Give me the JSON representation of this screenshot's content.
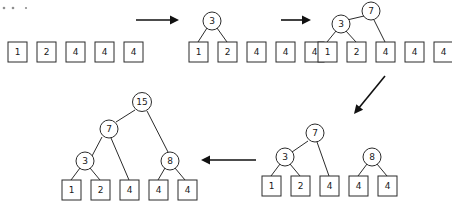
{
  "figure": {
    "title": "",
    "background_color": "#ffffff",
    "stroke_color": "#2b2b2b",
    "arrow_color": "#111111"
  },
  "specks": [
    {
      "name": "speck-1",
      "cx": 4,
      "cy": 8,
      "r": 1.3
    },
    {
      "name": "speck-2",
      "cx": 13,
      "cy": 8,
      "r": 1.3
    },
    {
      "name": "speck-3",
      "cx": 26,
      "cy": 8,
      "r": 1.1
    }
  ],
  "stages": [
    {
      "id": "stage-1",
      "label": "initial-forest",
      "leaves": [
        {
          "value": "1",
          "x": 8,
          "y": 42
        },
        {
          "value": "2",
          "x": 37,
          "y": 42
        },
        {
          "value": "4",
          "x": 66,
          "y": 42
        },
        {
          "value": "4",
          "x": 95,
          "y": 42
        },
        {
          "value": "4",
          "x": 124,
          "y": 42
        }
      ],
      "circles": [],
      "edges": []
    },
    {
      "id": "stage-2",
      "label": "merge-1-and-2-into-3",
      "leaves": [
        {
          "value": "1",
          "x": 189,
          "y": 42
        },
        {
          "value": "2",
          "x": 218,
          "y": 42
        },
        {
          "value": "4",
          "x": 247,
          "y": 42
        },
        {
          "value": "4",
          "x": 276,
          "y": 42
        },
        {
          "value": "4",
          "x": 305,
          "y": 42
        }
      ],
      "circles": [
        {
          "value": "3",
          "cx": 212,
          "cy": 21,
          "r": 9
        }
      ],
      "edges": [
        {
          "x1": 207,
          "y1": 28,
          "x2": 198,
          "y2": 42
        },
        {
          "x1": 217,
          "y1": 28,
          "x2": 227,
          "y2": 42
        }
      ]
    },
    {
      "id": "stage-3",
      "label": "merge-3-and-4-into-7",
      "leaves": [
        {
          "value": "1",
          "x": 318,
          "y": 42
        },
        {
          "value": "2",
          "x": 347,
          "y": 42
        },
        {
          "value": "4",
          "x": 376,
          "y": 42
        },
        {
          "value": "4",
          "x": 405,
          "y": 42
        },
        {
          "value": "4",
          "x": 434,
          "y": 42
        }
      ],
      "circles": [
        {
          "value": "3",
          "cx": 341,
          "cy": 24,
          "r": 9
        },
        {
          "value": "7",
          "cx": 371,
          "cy": 11,
          "r": 9
        }
      ],
      "edges": [
        {
          "x1": 336,
          "y1": 31,
          "x2": 327,
          "y2": 42
        },
        {
          "x1": 346,
          "y1": 31,
          "x2": 356,
          "y2": 42
        },
        {
          "x1": 347,
          "y1": 20,
          "x2": 364,
          "y2": 16
        },
        {
          "x1": 374,
          "y1": 20,
          "x2": 385,
          "y2": 42
        }
      ]
    },
    {
      "id": "stage-4",
      "label": "merge-4-and-4-into-8",
      "leaves": [
        {
          "value": "1",
          "x": 262,
          "y": 176
        },
        {
          "value": "2",
          "x": 291,
          "y": 176
        },
        {
          "value": "4",
          "x": 320,
          "y": 176
        },
        {
          "value": "4",
          "x": 349,
          "y": 176
        },
        {
          "value": "4",
          "x": 378,
          "y": 176
        }
      ],
      "circles": [
        {
          "value": "3",
          "cx": 285,
          "cy": 157,
          "r": 9
        },
        {
          "value": "7",
          "cx": 315,
          "cy": 133,
          "r": 9
        },
        {
          "value": "8",
          "cx": 372,
          "cy": 157,
          "r": 9
        }
      ],
      "edges": [
        {
          "x1": 280,
          "y1": 164,
          "x2": 271,
          "y2": 176
        },
        {
          "x1": 290,
          "y1": 164,
          "x2": 300,
          "y2": 176
        },
        {
          "x1": 292,
          "y1": 152,
          "x2": 308,
          "y2": 141
        },
        {
          "x1": 317,
          "y1": 142,
          "x2": 329,
          "y2": 176
        },
        {
          "x1": 367,
          "y1": 164,
          "x2": 358,
          "y2": 176
        },
        {
          "x1": 377,
          "y1": 164,
          "x2": 387,
          "y2": 176
        }
      ]
    },
    {
      "id": "stage-5",
      "label": "merge-7-and-8-into-15",
      "leaves": [
        {
          "value": "1",
          "x": 62,
          "y": 180
        },
        {
          "value": "2",
          "x": 91,
          "y": 180
        },
        {
          "value": "4",
          "x": 120,
          "y": 180
        },
        {
          "value": "4",
          "x": 149,
          "y": 180
        },
        {
          "value": "4",
          "x": 178,
          "y": 180
        }
      ],
      "circles": [
        {
          "value": "3",
          "cx": 85,
          "cy": 161,
          "r": 9
        },
        {
          "value": "7",
          "cx": 109,
          "cy": 129,
          "r": 9
        },
        {
          "value": "8",
          "cx": 170,
          "cy": 161,
          "r": 9
        },
        {
          "value": "15",
          "cx": 142,
          "cy": 102,
          "r": 9.5
        }
      ],
      "edges": [
        {
          "x1": 80,
          "y1": 168,
          "x2": 71,
          "y2": 180
        },
        {
          "x1": 90,
          "y1": 168,
          "x2": 100,
          "y2": 180
        },
        {
          "x1": 92,
          "y1": 156,
          "x2": 102,
          "y2": 137
        },
        {
          "x1": 111,
          "y1": 138,
          "x2": 129,
          "y2": 180
        },
        {
          "x1": 165,
          "y1": 168,
          "x2": 158,
          "y2": 180
        },
        {
          "x1": 175,
          "y1": 168,
          "x2": 185,
          "y2": 180
        },
        {
          "x1": 135,
          "y1": 110,
          "x2": 116,
          "y2": 122
        },
        {
          "x1": 147,
          "y1": 111,
          "x2": 168,
          "y2": 152
        }
      ]
    }
  ],
  "arrows": [
    {
      "name": "arrow-stage1-to-stage2",
      "x1": 136,
      "y1": 20,
      "x2": 179,
      "y2": 20,
      "direction": "right"
    },
    {
      "name": "arrow-stage2-to-stage3",
      "x1": 281,
      "y1": 20,
      "x2": 311,
      "y2": 20,
      "direction": "right"
    },
    {
      "name": "arrow-stage3-to-stage4",
      "x1": 385,
      "y1": 76,
      "x2": 354,
      "y2": 114,
      "direction": "down-left"
    },
    {
      "name": "arrow-stage4-to-stage5",
      "x1": 256,
      "y1": 160,
      "x2": 201,
      "y2": 160,
      "direction": "left"
    }
  ],
  "leaf_box": {
    "width": 19,
    "height": 20
  },
  "node_values": [
    "1",
    "2",
    "4",
    "4",
    "4",
    "3",
    "7",
    "8",
    "15"
  ]
}
